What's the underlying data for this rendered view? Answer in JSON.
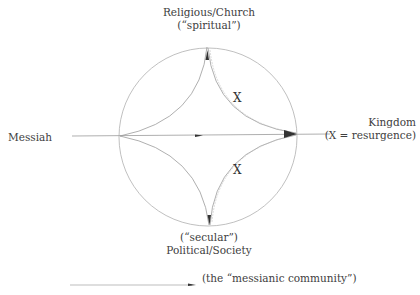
{
  "diagram": {
    "top_label": {
      "line1": "Religious/Church",
      "line2": "(“spiritual”)"
    },
    "bottom_label": {
      "line1": "(“secular”)",
      "line2": "Political/Society"
    },
    "left_label": "Messiah",
    "right_label": {
      "line1": "Kingdom",
      "line2": "(X = resurgence)"
    },
    "x_upper": "X",
    "x_lower": "X",
    "legend": {
      "text": "(the “messianic community”)"
    },
    "colors": {
      "line": "#8a8a8a",
      "circle": "#a8a8a8",
      "arrow": "#333333"
    }
  }
}
